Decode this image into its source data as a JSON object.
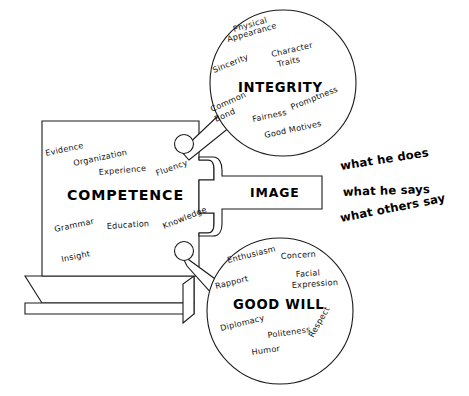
{
  "diagram": {
    "panel": {
      "heading": "COMPETENCE",
      "keywords": [
        {
          "label": "Evidence",
          "x": 46,
          "y": 156,
          "rot": -12
        },
        {
          "label": "Organization",
          "x": 74,
          "y": 166,
          "rot": -12
        },
        {
          "label": "Experience",
          "x": 99,
          "y": 175,
          "rot": -5
        },
        {
          "label": "Fluency",
          "x": 157,
          "y": 176,
          "rot": -20
        },
        {
          "label": "Grammar",
          "x": 55,
          "y": 232,
          "rot": -12
        },
        {
          "label": "Education",
          "x": 107,
          "y": 229,
          "rot": -4
        },
        {
          "label": "Knowledge",
          "x": 164,
          "y": 229,
          "rot": -22
        },
        {
          "label": "Insight",
          "x": 62,
          "y": 262,
          "rot": -12
        }
      ]
    },
    "image_box": {
      "heading": "IMAGE"
    },
    "top_circle": {
      "heading": "INTEGRITY",
      "keywords": [
        {
          "label": "Physical",
          "x": 234,
          "y": 32,
          "rot": -16
        },
        {
          "label": "Appearance",
          "x": 228,
          "y": 42,
          "rot": -16
        },
        {
          "label": "Character",
          "x": 272,
          "y": 57,
          "rot": -13
        },
        {
          "label": "Traits",
          "x": 278,
          "y": 67,
          "rot": -13
        },
        {
          "label": "Sincerity",
          "x": 214,
          "y": 73,
          "rot": -22
        },
        {
          "label": "Common",
          "x": 212,
          "y": 112,
          "rot": -24
        },
        {
          "label": "Bond",
          "x": 216,
          "y": 122,
          "rot": -24
        },
        {
          "label": "Fairness",
          "x": 253,
          "y": 122,
          "rot": -12
        },
        {
          "label": "Promptness",
          "x": 292,
          "y": 110,
          "rot": -22
        },
        {
          "label": "Good Motives",
          "x": 265,
          "y": 138,
          "rot": -12
        }
      ]
    },
    "bottom_circle": {
      "heading": "GOOD WILL",
      "keywords": [
        {
          "label": "Enthusiasm",
          "x": 228,
          "y": 263,
          "rot": -14
        },
        {
          "label": "Concern",
          "x": 281,
          "y": 259,
          "rot": -4
        },
        {
          "label": "Rapport",
          "x": 216,
          "y": 289,
          "rot": -14
        },
        {
          "label": "Facial",
          "x": 296,
          "y": 277,
          "rot": -4
        },
        {
          "label": "Expression",
          "x": 292,
          "y": 288,
          "rot": -4
        },
        {
          "label": "Diplomacy",
          "x": 221,
          "y": 331,
          "rot": -14
        },
        {
          "label": "Politeness",
          "x": 268,
          "y": 338,
          "rot": -8
        },
        {
          "label": "Respect",
          "x": 313,
          "y": 338,
          "rot": -60
        },
        {
          "label": "Humor",
          "x": 252,
          "y": 355,
          "rot": -8
        }
      ]
    },
    "side_notes": [
      {
        "label": "what he does",
        "x": 341,
        "y": 170,
        "rot": -9
      },
      {
        "label": "what he says",
        "x": 343,
        "y": 196,
        "rot": -2
      },
      {
        "label": "what others say",
        "x": 341,
        "y": 222,
        "rot": -11
      }
    ],
    "colors": {
      "ink": "#1a1a1a",
      "paper": "#ffffff"
    }
  }
}
